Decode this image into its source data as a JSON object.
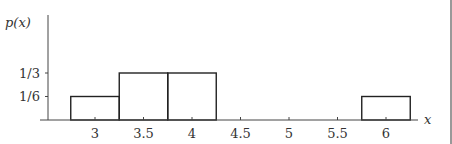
{
  "chart_data": {
    "type": "bar",
    "title": "",
    "xlabel": "x",
    "ylabel": "p(x)",
    "bins": [
      {
        "left": 2.75,
        "right": 3.25,
        "height": 0.16667,
        "label": "1/6"
      },
      {
        "left": 3.25,
        "right": 3.75,
        "height": 0.33333,
        "label": "1/3"
      },
      {
        "left": 3.75,
        "right": 4.25,
        "height": 0.33333,
        "label": "1/3"
      },
      {
        "left": 5.75,
        "right": 6.25,
        "height": 0.16667,
        "label": "1/6"
      }
    ],
    "categories": [
      "3",
      "3.5",
      "4",
      "4.5",
      "5",
      "5.5",
      "6"
    ],
    "x_ticks": [
      3,
      3.5,
      4,
      4.5,
      5,
      5.5,
      6
    ],
    "x_tick_labels": [
      "3",
      "3.5",
      "4",
      "4.5",
      "5",
      "5.5",
      "6"
    ],
    "y_ticks": [
      0.16667,
      0.33333
    ],
    "y_tick_labels": [
      "1/6",
      "1/3"
    ],
    "xlim": [
      2.5,
      6.6
    ],
    "ylim": [
      0,
      0.6
    ],
    "grid": false,
    "legend": null
  },
  "axes": {
    "ylabel_text": "p(x)",
    "xlabel_text": "x"
  }
}
